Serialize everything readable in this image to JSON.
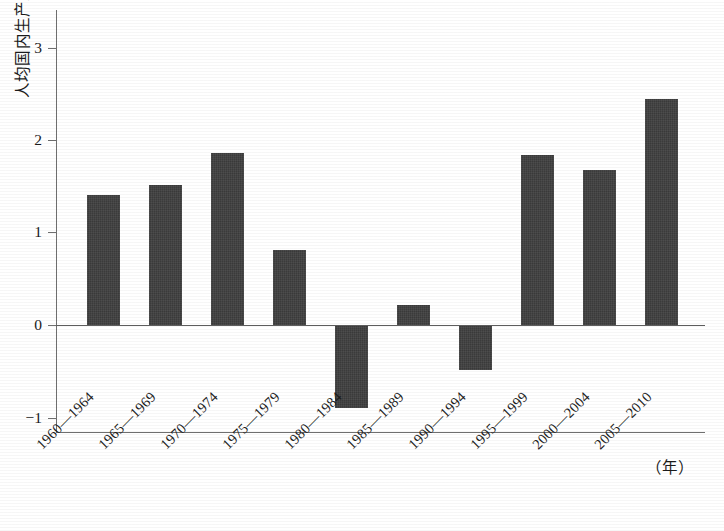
{
  "chart_data": {
    "type": "bar",
    "title": "",
    "xlabel": "（年）",
    "ylabel": "人均国内生产总值真实增长率中位数（%）",
    "categories": [
      "1960—1964",
      "1965—1969",
      "1970—1974",
      "1975—1979",
      "1980—1984",
      "1985—1989",
      "1990—1994",
      "1995—1999",
      "2000—2004",
      "2005—2010"
    ],
    "values": [
      1.4,
      1.51,
      1.85,
      0.81,
      -0.89,
      0.22,
      -0.48,
      1.83,
      1.67,
      2.43
    ],
    "ylim": [
      -1.35,
      3.4
    ],
    "yticks": [
      3,
      2,
      1,
      0,
      -1
    ],
    "ytick_labels": [
      "3",
      "2",
      "1",
      "0",
      "−1"
    ],
    "grid": false,
    "legend": null,
    "bar_color": "#3b3b3b",
    "axis_color": "#6f6f6f"
  },
  "axis": {
    "y_label": "人均国内生产总值真实增长率中位数（%）",
    "x_unit": "（年）"
  }
}
